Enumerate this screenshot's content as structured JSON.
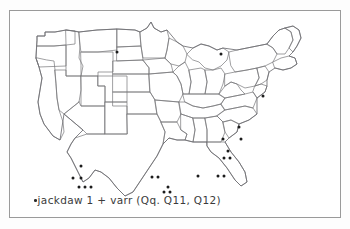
{
  "figure": {
    "kind": "dot-distribution-map",
    "region": "contiguous United States",
    "border_color": "#9a9a9a",
    "map_line_color": "#77777a",
    "dot_color": "#1c1c1c",
    "background_color": "#ffffff"
  },
  "caption": {
    "bullet": "•",
    "text": "jackdaw 1 + varr  (Qq. Q11, Q12)",
    "full": "•jackdaw 1 + varr  (Qq. Q11, Q12)",
    "headword": "jackdaw",
    "sense": "1",
    "variant": "varr",
    "questions": "(Qq. Q11, Q12)"
  },
  "chart_data": {
    "type": "scatter",
    "title": "jackdaw 1 + varr  (Qq. Q11, Q12)",
    "xlabel": "",
    "ylabel": "",
    "xlim": [
      0,
      332
    ],
    "ylim": [
      0,
      208
    ],
    "grid": false,
    "legend": "none",
    "point_count": 23,
    "marker": "filled-circle",
    "marker_radius": 1.5,
    "series": [
      {
        "name": "jackdaw 1 + varr",
        "points": [
          {
            "x": 108,
            "y": 42,
            "region": "upper-midwest"
          },
          {
            "x": 212,
            "y": 44,
            "region": "great-lakes"
          },
          {
            "x": 254,
            "y": 86,
            "region": "mid-atlantic"
          },
          {
            "x": 230,
            "y": 117,
            "region": "upper-south"
          },
          {
            "x": 214,
            "y": 129,
            "region": "upper-south"
          },
          {
            "x": 232,
            "y": 129,
            "region": "upper-south"
          },
          {
            "x": 219,
            "y": 141,
            "region": "southeast"
          },
          {
            "x": 215,
            "y": 148,
            "region": "southeast"
          },
          {
            "x": 221,
            "y": 148,
            "region": "southeast"
          },
          {
            "x": 189,
            "y": 166,
            "region": "deep-south"
          },
          {
            "x": 209,
            "y": 166,
            "region": "deep-south"
          },
          {
            "x": 215,
            "y": 166,
            "region": "deep-south"
          },
          {
            "x": 143,
            "y": 167,
            "region": "gulf-coast"
          },
          {
            "x": 149,
            "y": 167,
            "region": "gulf-coast"
          },
          {
            "x": 159,
            "y": 177,
            "region": "gulf-coast"
          },
          {
            "x": 155,
            "y": 182,
            "region": "gulf-coast"
          },
          {
            "x": 161,
            "y": 182,
            "region": "gulf-coast"
          },
          {
            "x": 72,
            "y": 156,
            "region": "texas"
          },
          {
            "x": 64,
            "y": 168,
            "region": "texas"
          },
          {
            "x": 72,
            "y": 168,
            "region": "texas"
          },
          {
            "x": 70,
            "y": 177,
            "region": "texas"
          },
          {
            "x": 76,
            "y": 177,
            "region": "texas"
          },
          {
            "x": 82,
            "y": 177,
            "region": "texas"
          }
        ]
      }
    ]
  }
}
